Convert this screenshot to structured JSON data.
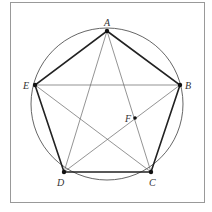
{
  "diagram": {
    "points": {
      "A": {
        "label": "A",
        "x": 107,
        "y": 31
      },
      "B": {
        "label": "B",
        "x": 180,
        "y": 85
      },
      "C": {
        "label": "C",
        "x": 151,
        "y": 172
      },
      "D": {
        "label": "D",
        "x": 64,
        "y": 172
      },
      "E": {
        "label": "E",
        "x": 35,
        "y": 85
      },
      "F": {
        "label": "F",
        "x": 135,
        "y": 118
      }
    },
    "circle": {
      "cx": 107,
      "cy": 104,
      "r": 76
    },
    "colors": {
      "frame": "#999999",
      "line": "#555555",
      "edge": "#222222"
    }
  }
}
